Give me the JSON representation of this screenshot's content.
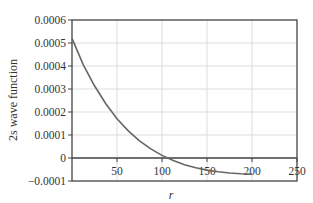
{
  "chart_data": {
    "type": "line",
    "title": "",
    "xlabel": "r",
    "ylabel": "2s wave function",
    "xlim": [
      0,
      250
    ],
    "ylim": [
      -0.0001,
      0.0006
    ],
    "grid": true,
    "legend": null,
    "x_ticks": [
      50,
      100,
      150,
      200,
      250
    ],
    "x_tick_labels": [
      "50",
      "100",
      "150",
      "200",
      "250"
    ],
    "y_ticks": [
      -0.0001,
      0,
      0.0001,
      0.0002,
      0.0003,
      0.0004,
      0.0005,
      0.0006
    ],
    "y_tick_labels": [
      "−0.0001",
      "0",
      "0.0001",
      "0.0002",
      "0.0003",
      "0.0004",
      "0.0005",
      "0.0006"
    ],
    "series": [
      {
        "name": "2s wave function",
        "color": "#666666",
        "x": [
          0,
          12.5,
          25,
          37.5,
          50,
          62.5,
          75,
          87.5,
          100,
          112.5,
          125,
          137.5,
          150,
          162.5,
          175,
          187.5,
          200
        ],
        "values": [
          0.00052,
          0.000405,
          0.000314,
          0.000236,
          0.000171,
          0.000118,
          7.45e-05,
          3.95e-05,
          1.11e-05,
          -1.12e-05,
          -2.9e-05,
          -4.25e-05,
          -5.26e-05,
          -6e-05,
          -6.51e-05,
          -6.84e-05,
          -6.99e-05
        ]
      }
    ]
  },
  "colors": {
    "curve": "#666666",
    "axis": "#444444",
    "grid": "#dddddd",
    "text": "#333333"
  }
}
